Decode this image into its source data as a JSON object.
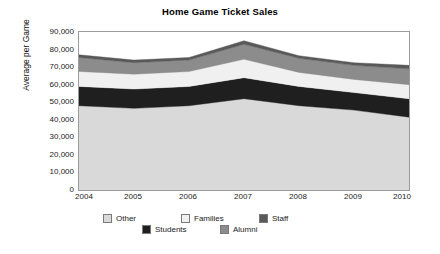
{
  "chart_data": {
    "type": "area",
    "stacked": true,
    "title": "Home Game Ticket Sales",
    "xlabel": "",
    "ylabel": "Average per Game",
    "categories": [
      "2004",
      "2005",
      "2006",
      "2007",
      "2008",
      "2009",
      "2010"
    ],
    "x": [
      2004,
      2005,
      2006,
      2007,
      2008,
      2009,
      2010
    ],
    "ylim": [
      0,
      90000
    ],
    "yticks": [
      0,
      10000,
      20000,
      30000,
      40000,
      50000,
      60000,
      70000,
      80000,
      90000
    ],
    "ytick_labels": [
      "0",
      "10,000",
      "20,000",
      "30,000",
      "40,000",
      "50,000",
      "60,000",
      "70,000",
      "80,000",
      "90,000"
    ],
    "grid": false,
    "legend_position": "bottom",
    "stack_order_bottom_to_top": [
      "Other",
      "Students",
      "Families",
      "Alumni",
      "Staff"
    ],
    "series": [
      {
        "name": "Other",
        "color": "#d9d9d9",
        "values": [
          48000,
          46500,
          48000,
          52000,
          48000,
          45500,
          41500
        ]
      },
      {
        "name": "Students",
        "color": "#1f1f1f",
        "values": [
          11000,
          11000,
          11000,
          12000,
          11000,
          10000,
          10500
        ]
      },
      {
        "name": "Families",
        "color": "#f0f0f0",
        "values": [
          8500,
          8500,
          8500,
          10500,
          8000,
          7500,
          8000
        ]
      },
      {
        "name": "Alumni",
        "color": "#8c8c8c",
        "values": [
          8000,
          6500,
          6500,
          8500,
          8000,
          8000,
          9000
        ]
      },
      {
        "name": "Staff",
        "color": "#595959",
        "values": [
          1500,
          1500,
          1500,
          2000,
          1500,
          1500,
          2000
        ]
      }
    ],
    "totals": [
      77000,
      74000,
      75500,
      85000,
      76500,
      72500,
      71000
    ]
  },
  "legend": {
    "rows": [
      [
        {
          "label": "Other",
          "color": "#d9d9d9"
        },
        {
          "label": "Families",
          "color": "#f0f0f0"
        },
        {
          "label": "Staff",
          "color": "#595959"
        }
      ],
      [
        {
          "label": "Students",
          "color": "#1f1f1f"
        },
        {
          "label": "Alumni",
          "color": "#8c8c8c"
        }
      ]
    ]
  },
  "colors": {
    "plot_border": "#9b9b9b",
    "background": "#ffffff",
    "text": "#1a1a1a"
  }
}
